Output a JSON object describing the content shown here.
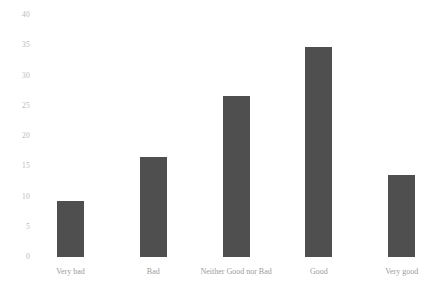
{
  "chart_data": {
    "type": "bar",
    "title": "",
    "subtitle": "",
    "xlabel": "",
    "ylabel": "",
    "categories": [
      "Very bad",
      "Bad",
      "Neither Good nor Bad",
      "Good",
      "Very good"
    ],
    "values": [
      9.2,
      16.6,
      26.6,
      34.7,
      13.5
    ],
    "ylim": [
      0,
      40
    ],
    "yticks": [
      0,
      5,
      10,
      15,
      20,
      25,
      30,
      35,
      40
    ],
    "ytick_labels": [
      "0",
      "5",
      "10",
      "15",
      "20",
      "25",
      "30",
      "35",
      "40"
    ],
    "grid": false,
    "legend": null,
    "bar_color": "#4f4f4f",
    "background_color": "#ffffff",
    "tick_label_color": "#b9b9b9",
    "category_label_color": "#9c9c9c"
  }
}
